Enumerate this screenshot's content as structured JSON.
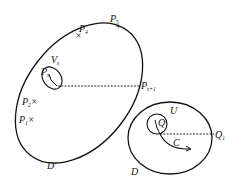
{
  "diagram": {
    "colors": {
      "stroke": "#111111",
      "background": "#ffffff"
    },
    "regions": {
      "d_prime": {
        "label": "D'"
      },
      "d": {
        "label": "D"
      }
    },
    "points": {
      "p4": {
        "main": "P",
        "sub": "4",
        "marker": "×"
      },
      "p5": {
        "main": "P",
        "sub": "5",
        "marker": "+"
      },
      "ps": {
        "main": "P",
        "sub": "s"
      },
      "ps1": {
        "main": "P",
        "sub": "s+1"
      },
      "p2": {
        "main": "P",
        "sub": "2",
        "marker": "×"
      },
      "p1": {
        "main": "P",
        "sub": "1",
        "marker": "×"
      },
      "q": {
        "main": "Q"
      },
      "q1": {
        "main": "Q",
        "sub": "1"
      }
    },
    "neighborhoods": {
      "vs": {
        "main": "V",
        "sub": "s"
      },
      "u": {
        "main": "U"
      }
    },
    "curve": {
      "label": "C"
    }
  }
}
